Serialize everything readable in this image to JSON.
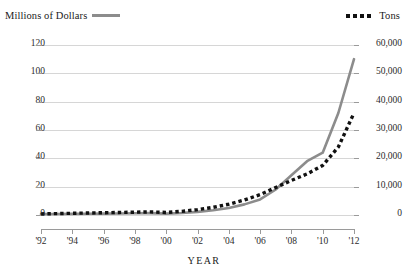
{
  "legend": {
    "left": {
      "label": "Millions of Dollars",
      "swatch": "solid-line-swatch",
      "color": "#8c8c8c"
    },
    "right": {
      "label": "Tons",
      "swatch": "dotted-line-swatch",
      "color": "#111111"
    }
  },
  "axis_title_x": "YEAR",
  "y_left_ticks": [
    "0",
    "20",
    "40",
    "60",
    "80",
    "100",
    "120"
  ],
  "y_right_ticks": [
    "0",
    "10,000",
    "20,000",
    "30,000",
    "40,000",
    "50,000",
    "60,000"
  ],
  "x_ticks": [
    "'92",
    "'94",
    "'96",
    "'98",
    "'00",
    "'02",
    "'04",
    "'06",
    "'08",
    "'10",
    "'12"
  ],
  "chart_data": {
    "type": "line",
    "title": "",
    "xlabel": "YEAR",
    "ylabel": "",
    "grid": true,
    "legend_position": "top",
    "x": [
      1992,
      1993,
      1994,
      1995,
      1996,
      1997,
      1998,
      1999,
      2000,
      2001,
      2002,
      2003,
      2004,
      2005,
      2006,
      2007,
      2008,
      2009,
      2010,
      2011,
      2012
    ],
    "xlim": [
      1992,
      2012
    ],
    "series": [
      {
        "name": "Millions of Dollars",
        "axis": "left",
        "color": "#8c8c8c",
        "style": "solid",
        "ylabel": "Millions of Dollars",
        "ylim": [
          0,
          120
        ],
        "yticks": [
          0,
          20,
          40,
          60,
          80,
          100,
          120
        ],
        "values": [
          0.6,
          0.7,
          0.8,
          0.9,
          1.0,
          1.1,
          1.2,
          1.3,
          1.0,
          1.4,
          2.2,
          3.4,
          5.0,
          7.5,
          11.0,
          18.0,
          28.0,
          38.0,
          44.0,
          72.0,
          110.0
        ]
      },
      {
        "name": "Tons",
        "axis": "right",
        "color": "#111111",
        "style": "dotted",
        "ylabel": "Tons",
        "ylim": [
          0,
          60000
        ],
        "yticks": [
          0,
          10000,
          20000,
          30000,
          40000,
          50000,
          60000
        ],
        "values": [
          400,
          500,
          600,
          700,
          800,
          900,
          1000,
          1100,
          900,
          1300,
          1900,
          2700,
          3800,
          5300,
          7200,
          9700,
          12200,
          14500,
          17500,
          24000,
          36000
        ]
      }
    ]
  }
}
